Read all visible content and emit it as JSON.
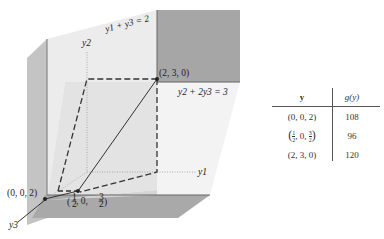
{
  "diagram": {
    "axes": {
      "y1": "y1",
      "y2": "y2",
      "y3": "y3"
    },
    "constraints": {
      "c1": "y1 + y3 = 2",
      "c2": "y2 + 2y3 = 3"
    },
    "points": {
      "p1": "(2, 3, 0)",
      "p2": "(0, 0, 2)",
      "p3_prefix": "(",
      "p3_a_num": "1",
      "p3_a_den": "2",
      "p3_mid": ", 0, ",
      "p3_b_num": "3",
      "p3_b_den": "2",
      "p3_suffix": ")"
    },
    "colors": {
      "dark_face": "#a9a9a9",
      "light_face": "#e9e9e9",
      "mid_face": "#c8c8c8",
      "line": "#333333"
    }
  },
  "table": {
    "headers": {
      "y": "y",
      "g": "g(y)"
    },
    "rows": [
      {
        "y": "(0, 0, 2)",
        "g": "108",
        "marker": ""
      },
      {
        "y_frac": true,
        "y_prefix": "(",
        "a_num": "1",
        "a_den": "2",
        "mid": ", 0, ",
        "b_num": "3",
        "b_den": "2",
        "y_suffix": ")",
        "g": "96",
        "marker": "←"
      },
      {
        "y": "(2, 3, 0)",
        "g": "120",
        "marker": ""
      }
    ]
  }
}
